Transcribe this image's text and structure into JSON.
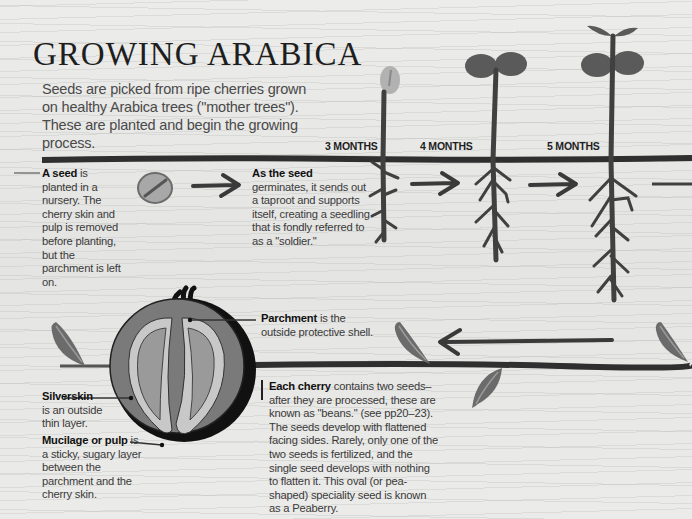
{
  "title": "GROWING ARABICA",
  "intro": "Seeds are picked from ripe cherries grown on healthy Arabica trees (\"mother trees\"). These are planted and begin the growing process.",
  "timeline": {
    "months": [
      {
        "label": "3 MONTHS"
      },
      {
        "label": "4 MONTHS"
      },
      {
        "label": "5 MONTHS"
      }
    ]
  },
  "stages": {
    "seed": {
      "bold": "A seed",
      "text": " is planted in a nursery. The cherry skin and pulp is removed before planting, but the parchment is left on."
    },
    "germination": {
      "bold": "As the seed",
      "text": " germinates, it sends out a taproot and supports itself, creating a seedling that is fondly referred to as a \"soldier.\""
    }
  },
  "cherry": {
    "parchment": {
      "bold": "Parchment",
      "text": " is the outside protective shell."
    },
    "silverskin": {
      "bold": "Silverskin",
      "text": "is an outside thin layer."
    },
    "mucilage": {
      "bold": "Mucilage or pulp",
      "text": " is a sticky, sugary layer between the parchment and the cherry skin."
    },
    "each_cherry": {
      "bold": "Each cherry",
      "text": " contains two seeds– after they are processed, these are known as \"beans.\" (see pp20–23). The seeds develop with flattened facing sides. Rarely, only one of the two seeds is fertilized, and the single seed develops with nothing to flatten it. This oval (or pea-shaped) speciality seed is known as a Peaberry."
    }
  },
  "colors": {
    "ink": "#3a3a3a",
    "leaf": "#6b6b6b",
    "seed": "#a8a8a8",
    "cherry_outer": "#1a1a1a",
    "cherry_flesh": "#7a7a7a",
    "bean_light": "#c8c8c8",
    "bean_mid": "#9a9a9a"
  }
}
